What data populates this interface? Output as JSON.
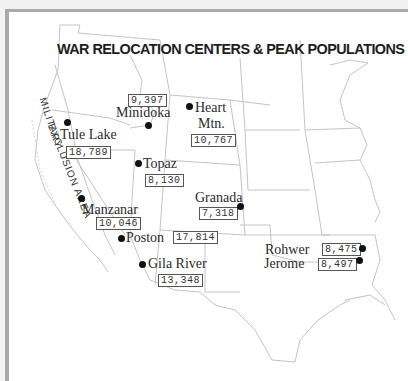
{
  "map": {
    "title": "WAR RELOCATION CENTERS & PEAK POPULATIONS",
    "zone_label": {
      "part1": "MILITARY",
      "part2": "EXCLUSION AREA"
    },
    "centers": [
      {
        "name": "Tule Lake",
        "population": "18,789"
      },
      {
        "name": "Minidoka",
        "population": "9,397"
      },
      {
        "name": "Heart Mtn.",
        "name_line1": "Heart",
        "name_line2": "Mtn.",
        "population": "10,767"
      },
      {
        "name": "Topaz",
        "population": "8,130"
      },
      {
        "name": "Granada",
        "population": "7,318"
      },
      {
        "name": "Manzanar",
        "population": "10,046"
      },
      {
        "name": "Poston",
        "population": "17,814"
      },
      {
        "name": "Gila River",
        "population": "13,348"
      },
      {
        "name": "Rohwer",
        "population": "8,475"
      },
      {
        "name": "Jerome",
        "population": "8,497"
      }
    ],
    "colors": {
      "frame": "#a9a9a9",
      "state_lines": "#c8c8c8",
      "dot": "#111111",
      "text": "#2a2a2a"
    }
  }
}
